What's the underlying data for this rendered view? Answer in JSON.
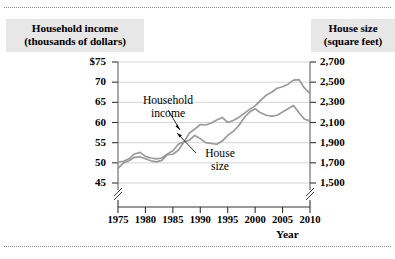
{
  "figure": {
    "rules": {
      "top_divider": "dotted-rule",
      "bottom_divider": "dotted-rule"
    }
  },
  "chart_data": {
    "type": "line",
    "title": "",
    "xlabel": "Year",
    "x": [
      1975,
      1976,
      1977,
      1978,
      1979,
      1980,
      1981,
      1982,
      1983,
      1984,
      1985,
      1986,
      1987,
      1988,
      1989,
      1990,
      1991,
      1992,
      1993,
      1994,
      1995,
      1996,
      1997,
      1998,
      1999,
      2000,
      2001,
      2002,
      2003,
      2004,
      2005,
      2006,
      2007,
      2008,
      2009,
      2010
    ],
    "xlim": [
      1975,
      2010
    ],
    "xticks": [
      "1975",
      "1980",
      "1985",
      "1990",
      "1995",
      "2000",
      "2005",
      "2010"
    ],
    "grid": true,
    "axis_break": true,
    "legend_position": "inline-callout",
    "left_axis": {
      "label": "Household income (thousands of dollars)",
      "label_line1": "Household income",
      "label_line2": "(thousands of dollars)",
      "ticks": [
        "$75",
        "70",
        "65",
        "60",
        "55",
        "50",
        "45"
      ],
      "tick_values": [
        75,
        70,
        65,
        60,
        55,
        50,
        45
      ],
      "ylim": [
        45,
        75
      ]
    },
    "right_axis": {
      "label": "House size (square feet)",
      "label_line1": "House size",
      "label_line2": "(square feet)",
      "ticks": [
        "2,700",
        "2,500",
        "2,300",
        "2,100",
        "1,900",
        "1,700",
        "1,500"
      ],
      "tick_values": [
        2700,
        2500,
        2300,
        2100,
        1900,
        1700,
        1500
      ],
      "ylim": [
        1500,
        2700
      ]
    },
    "series": [
      {
        "name": "Household income",
        "label_line1": "Household",
        "label_line2": "income",
        "axis": "left",
        "units": "thousands of dollars",
        "color": "#9a9a9a",
        "values": [
          50.2,
          50.4,
          51.0,
          52.2,
          52.6,
          51.6,
          51.2,
          51.0,
          51.2,
          52.2,
          53.0,
          54.6,
          55.2,
          55.6,
          56.8,
          56.0,
          55.0,
          54.8,
          54.6,
          55.4,
          56.8,
          57.8,
          59.2,
          61.2,
          62.6,
          63.4,
          62.4,
          61.8,
          61.6,
          61.8,
          62.6,
          63.4,
          64.2,
          62.4,
          60.8,
          60.4
        ]
      },
      {
        "name": "House size",
        "label_line1": "House",
        "label_line2": "size",
        "axis": "right",
        "units": "square feet",
        "color": "#9a9a9a",
        "values": [
          1645,
          1700,
          1720,
          1755,
          1760,
          1740,
          1720,
          1710,
          1725,
          1780,
          1785,
          1825,
          1905,
          1995,
          2035,
          2080,
          2075,
          2095,
          2125,
          2150,
          2100,
          2120,
          2150,
          2190,
          2230,
          2265,
          2320,
          2370,
          2400,
          2440,
          2455,
          2480,
          2520,
          2525,
          2440,
          2390
        ]
      }
    ]
  }
}
